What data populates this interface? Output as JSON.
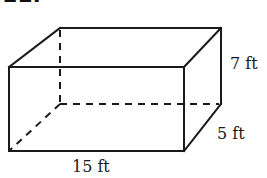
{
  "figure": {
    "heading": "11.",
    "shape": "rectangular prism",
    "labels": {
      "length": "15 ft",
      "width": "5 ft",
      "height": "7 ft"
    },
    "colors": {
      "line": "#1a1a1a",
      "background": "#ffffff"
    }
  }
}
